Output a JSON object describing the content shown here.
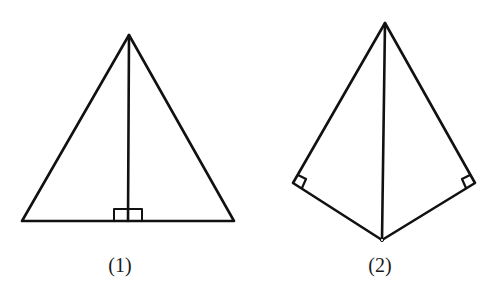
{
  "figures": [
    {
      "id": "figure-1",
      "label": "(1)",
      "description": "Isosceles triangle with altitude from apex perpendicular to base",
      "vertices": {
        "apex": [
          129,
          35
        ],
        "base_left": [
          22,
          221
        ],
        "base_right": [
          234,
          221
        ],
        "foot": [
          128,
          221
        ]
      },
      "right_angle_marks": [
        "at foot of altitude, both sides"
      ]
    },
    {
      "id": "figure-2",
      "label": "(2)",
      "description": "Kite composed of two right triangles sharing a diagonal",
      "vertices": {
        "top": [
          385,
          23
        ],
        "left": [
          293,
          183
        ],
        "right": [
          475,
          183
        ],
        "bottom": [
          382,
          240
        ]
      },
      "right_angle_marks": [
        "at left vertex",
        "at right vertex"
      ]
    }
  ],
  "colors": {
    "stroke": "#111111",
    "background": "#ffffff"
  }
}
